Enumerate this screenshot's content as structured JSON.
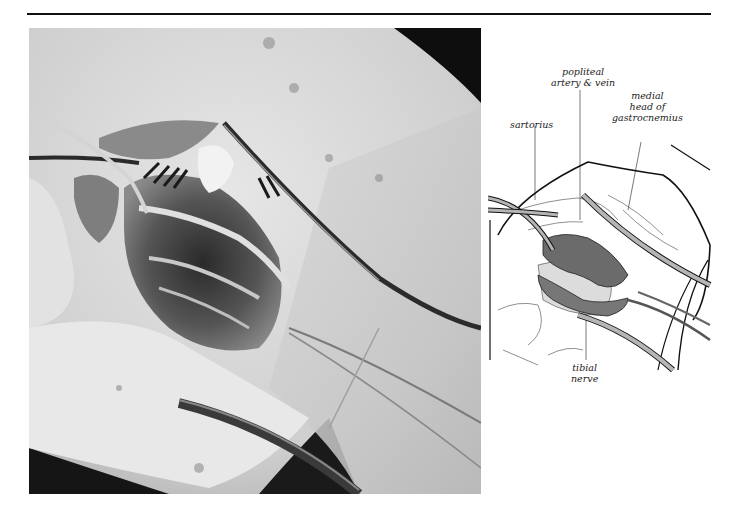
{
  "figure": {
    "photo": {
      "description": "Intraoperative photograph of posterior knee dissection with vessel loops and tubing retracting structures",
      "colors": {
        "tissue": "#d9d9d9",
        "fat": "#e8e8e8",
        "cavity": "#3a3a3a",
        "background_dark": "#111111"
      }
    },
    "illustration": {
      "labels": {
        "sartorius": "sartorius",
        "popliteal_line1": "popliteal",
        "popliteal_line2": "artery & vein",
        "gastroc_line1": "medial",
        "gastroc_line2": "head of",
        "gastroc_line3": "gastrocnemius",
        "tibial_line1": "tibial",
        "tibial_line2": "nerve"
      },
      "colors": {
        "vessel": "#6b6b6b",
        "tube": "#b5b5b5",
        "outline": "#111111"
      }
    }
  }
}
